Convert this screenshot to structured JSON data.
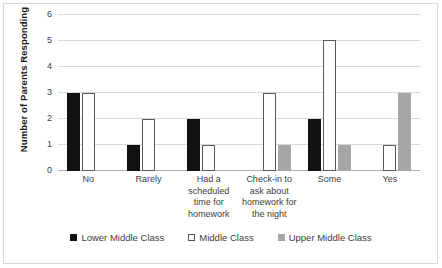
{
  "chart_data": {
    "type": "bar",
    "title": "",
    "subtitle": "",
    "xlabel": "",
    "ylabel": "Number of Parents Responding",
    "ylim": [
      0,
      6
    ],
    "ytick_step": 1,
    "yticks": [
      "6",
      "5",
      "4",
      "3",
      "2",
      "1",
      "0"
    ],
    "grid": "horizontal",
    "legend_position": "bottom",
    "categories": [
      "No",
      "Rarely",
      "Had a scheduled time for homework",
      "Check-in to ask about homework for the night",
      "Some",
      "Yes"
    ],
    "series": [
      {
        "name": "Lower Middle Class",
        "color": "#111111",
        "values": [
          3,
          1,
          2,
          0,
          2,
          0
        ]
      },
      {
        "name": "Middle Class",
        "color": "#ffffff",
        "values": [
          3,
          2,
          1,
          3,
          5,
          1
        ]
      },
      {
        "name": "Upper Middle Class",
        "color": "#a6a6a6",
        "values": [
          0,
          0,
          0,
          1,
          1,
          3
        ]
      }
    ]
  },
  "legend": {
    "items": [
      {
        "label": "Lower Middle Class"
      },
      {
        "label": "Middle Class"
      },
      {
        "label": "Upper Middle Class"
      }
    ]
  }
}
